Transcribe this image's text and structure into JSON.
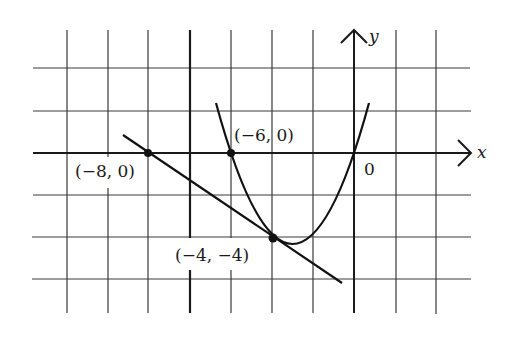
{
  "diagram": {
    "type": "coordinate-plane",
    "axes": {
      "x_label": "x",
      "y_label": "y",
      "origin_label": "0"
    },
    "grid": {
      "vertical_lines_px": [
        67,
        108,
        148,
        190,
        231,
        272,
        313,
        354,
        396,
        436
      ],
      "horizontal_lines_px": [
        68,
        111,
        153,
        195,
        237,
        279
      ],
      "emphasized_vertical_px": 190
    },
    "curves": [
      {
        "name": "parabola",
        "description": "upward-opening parabola through (-6, 0) and (0, 0), tangent to line at (-4, -4)"
      },
      {
        "name": "tangent-line",
        "description": "straight line through (-8, 0) and (-4, -4)"
      }
    ],
    "points": [
      {
        "id": "p1",
        "label": "(−8, 0)"
      },
      {
        "id": "p2",
        "label": "(−6, 0)"
      },
      {
        "id": "p3",
        "label": "(−4, −4)"
      }
    ]
  }
}
